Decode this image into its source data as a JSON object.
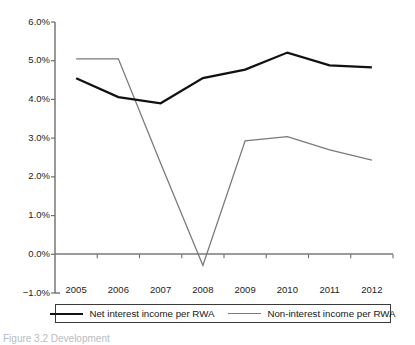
{
  "chart_data": {
    "type": "line",
    "title": "",
    "xlabel": "",
    "ylabel": "",
    "categories": [
      "2005",
      "2006",
      "2007",
      "2008",
      "2009",
      "2010",
      "2011",
      "2012"
    ],
    "ylim": [
      -1.0,
      6.0
    ],
    "ytick_values": [
      6.0,
      5.0,
      4.0,
      3.0,
      2.0,
      1.0,
      0.0,
      -1.0
    ],
    "ytick_labels": [
      "6.0%",
      "5.0%",
      "4.0%",
      "3.0%",
      "2.0%",
      "1.0%",
      "0.0%",
      "-1.0%"
    ],
    "grid": false,
    "zero_line": true,
    "legend_position": "bottom",
    "series": [
      {
        "name": "Net interest income per RWA",
        "color": "#111111",
        "width": 2.2,
        "values": [
          4.55,
          4.06,
          3.9,
          4.55,
          4.77,
          5.21,
          4.88,
          4.83
        ]
      },
      {
        "name": "Non-interest income per RWA",
        "color": "#7a7a7a",
        "width": 1.3,
        "values": [
          5.05,
          5.05,
          2.35,
          -0.29,
          2.93,
          3.04,
          2.7,
          2.43
        ]
      }
    ]
  },
  "axis": {
    "y_labels": [
      "6.0%",
      "5.0%",
      "4.0%",
      "3.0%",
      "2.0%",
      "1.0%",
      "0.0%",
      "-1.0%"
    ],
    "x_labels": [
      "2005",
      "2006",
      "2007",
      "2008",
      "2009",
      "2010",
      "2011",
      "2012"
    ]
  },
  "legend": {
    "entries": [
      {
        "label": "Net interest income per RWA",
        "style": "black"
      },
      {
        "label": "Non-interest income per RWA",
        "style": "gray"
      }
    ]
  },
  "caption": {
    "text": "Figure 3.2  Development"
  },
  "colors": {
    "series_black": "#111111",
    "series_gray": "#7a7a7a",
    "axis": "#6e6e6e",
    "text": "#1c1c1c"
  }
}
